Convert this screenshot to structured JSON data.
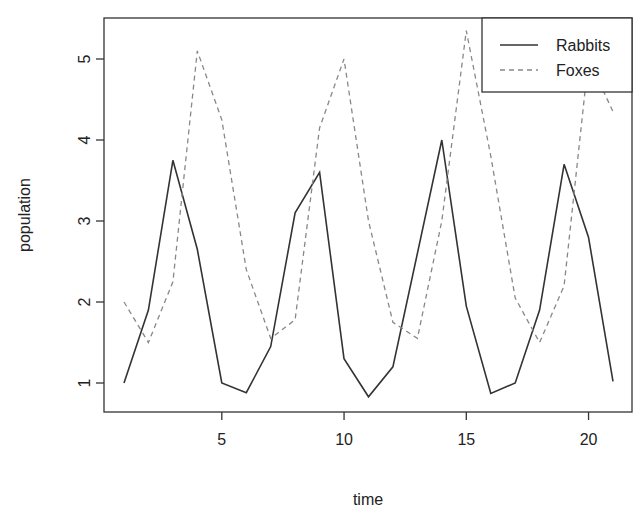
{
  "chart_data": {
    "type": "line",
    "title": "",
    "xlabel": "time",
    "ylabel": "population",
    "xlim": [
      0.2,
      21.8
    ],
    "ylim": [
      0.6,
      5.5
    ],
    "x_ticks": [
      5,
      10,
      15,
      20
    ],
    "y_ticks": [
      1,
      2,
      3,
      4,
      5
    ],
    "grid": false,
    "legend_position": "topright",
    "x": [
      1,
      2,
      3,
      4,
      5,
      6,
      7,
      8,
      9,
      10,
      11,
      12,
      13,
      14,
      15,
      16,
      17,
      18,
      19,
      20,
      21
    ],
    "series": [
      {
        "name": "Rabbits",
        "style": "solid",
        "color": "#333333",
        "values": [
          1.0,
          1.9,
          3.75,
          2.65,
          1.0,
          0.88,
          1.45,
          3.1,
          3.6,
          1.3,
          0.83,
          1.2,
          2.6,
          4.0,
          1.95,
          0.87,
          1.0,
          1.9,
          3.7,
          2.8,
          1.02
        ]
      },
      {
        "name": "Foxes",
        "style": "dashed",
        "color": "#888888",
        "values": [
          2.0,
          1.5,
          2.25,
          5.1,
          4.25,
          2.4,
          1.55,
          1.78,
          4.15,
          5.0,
          3.0,
          1.75,
          1.55,
          3.0,
          5.35,
          3.8,
          2.05,
          1.5,
          2.2,
          5.0,
          4.35
        ]
      }
    ]
  },
  "plot_area": {
    "left": 104,
    "top": 18,
    "right": 632,
    "bottom": 412
  },
  "legend": {
    "items": [
      "Rabbits",
      "Foxes"
    ]
  }
}
